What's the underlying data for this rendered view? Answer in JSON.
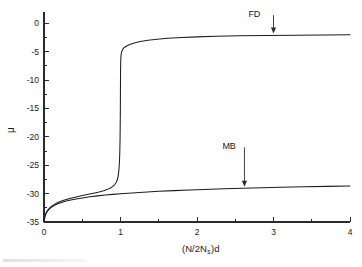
{
  "chart_data": {
    "type": "line",
    "title": "",
    "xlabel": "(N/2N_s)d",
    "xlabel_parts": {
      "pre": "(N/2N",
      "sub": "s",
      "post": ")d"
    },
    "ylabel": "μ",
    "xlim": [
      0,
      4
    ],
    "ylim": [
      -35,
      2
    ],
    "grid": false,
    "legend_position": "inline-annotations",
    "x_ticks": [
      0,
      1,
      2,
      3,
      4
    ],
    "x_tick_labels": [
      "0",
      "1",
      "2",
      "3",
      "4"
    ],
    "x_minor_ticks": [
      0.5,
      1.5,
      2.5,
      3.5
    ],
    "y_ticks": [
      0,
      -5,
      -10,
      -15,
      -20,
      -25,
      -30,
      -35
    ],
    "y_tick_labels": [
      "0",
      "-5",
      "-10",
      "-15",
      "-20",
      "-25",
      "-30",
      "-35"
    ],
    "y_minor_ticks": [
      -2.5,
      -7.5,
      -12.5,
      -17.5,
      -22.5,
      -27.5,
      -32.5
    ],
    "annotations": [
      {
        "text": "FD",
        "x": 2.75,
        "y": 1.1,
        "arrow_to_x": 3.0,
        "arrow_to_y": -1.8
      },
      {
        "text": "MB",
        "x": 2.42,
        "y": -22.2,
        "arrow_to_x": 2.62,
        "arrow_to_y": -28.8
      }
    ],
    "series": [
      {
        "name": "FD",
        "label": "Fermi-Dirac",
        "color": "#1d1d1d",
        "points": [
          [
            0.0,
            -35.0
          ],
          [
            0.01,
            -34.1
          ],
          [
            0.02,
            -33.65
          ],
          [
            0.035,
            -33.2
          ],
          [
            0.05,
            -32.9
          ],
          [
            0.075,
            -32.5
          ],
          [
            0.1,
            -32.2
          ],
          [
            0.14,
            -31.85
          ],
          [
            0.18,
            -31.58
          ],
          [
            0.23,
            -31.3
          ],
          [
            0.29,
            -31.02
          ],
          [
            0.35,
            -30.8
          ],
          [
            0.42,
            -30.58
          ],
          [
            0.5,
            -30.35
          ],
          [
            0.58,
            -30.12
          ],
          [
            0.65,
            -29.92
          ],
          [
            0.72,
            -29.7
          ],
          [
            0.78,
            -29.48
          ],
          [
            0.83,
            -29.25
          ],
          [
            0.87,
            -29.0
          ],
          [
            0.9,
            -28.72
          ],
          [
            0.925,
            -28.4
          ],
          [
            0.945,
            -28.0
          ],
          [
            0.958,
            -27.55
          ],
          [
            0.968,
            -27.0
          ],
          [
            0.976,
            -26.3
          ],
          [
            0.982,
            -25.4
          ],
          [
            0.987,
            -24.2
          ],
          [
            0.991,
            -22.6
          ],
          [
            0.994,
            -20.6
          ],
          [
            0.996,
            -18.3
          ],
          [
            0.998,
            -15.4
          ],
          [
            0.999,
            -12.6
          ],
          [
            1.0,
            -10.0
          ],
          [
            1.001,
            -8.0
          ],
          [
            1.003,
            -6.6
          ],
          [
            1.006,
            -5.8
          ],
          [
            1.011,
            -5.25
          ],
          [
            1.018,
            -4.9
          ],
          [
            1.03,
            -4.55
          ],
          [
            1.05,
            -4.25
          ],
          [
            1.08,
            -3.98
          ],
          [
            1.12,
            -3.72
          ],
          [
            1.18,
            -3.45
          ],
          [
            1.26,
            -3.2
          ],
          [
            1.36,
            -2.98
          ],
          [
            1.48,
            -2.8
          ],
          [
            1.62,
            -2.64
          ],
          [
            1.8,
            -2.5
          ],
          [
            2.0,
            -2.38
          ],
          [
            2.25,
            -2.28
          ],
          [
            2.55,
            -2.2
          ],
          [
            2.9,
            -2.13
          ],
          [
            3.3,
            -2.08
          ],
          [
            3.65,
            -2.04
          ],
          [
            4.0,
            -2.0
          ]
        ]
      },
      {
        "name": "MB",
        "label": "Maxwell-Boltzmann",
        "color": "#1d1d1d",
        "points": [
          [
            0.0,
            -35.0
          ],
          [
            0.01,
            -34.15
          ],
          [
            0.02,
            -33.7
          ],
          [
            0.035,
            -33.3
          ],
          [
            0.05,
            -33.0
          ],
          [
            0.075,
            -32.65
          ],
          [
            0.1,
            -32.38
          ],
          [
            0.14,
            -32.05
          ],
          [
            0.18,
            -31.8
          ],
          [
            0.23,
            -31.55
          ],
          [
            0.29,
            -31.32
          ],
          [
            0.35,
            -31.12
          ],
          [
            0.42,
            -30.95
          ],
          [
            0.5,
            -30.76
          ],
          [
            0.6,
            -30.56
          ],
          [
            0.7,
            -30.4
          ],
          [
            0.8,
            -30.26
          ],
          [
            0.9,
            -30.13
          ],
          [
            1.0,
            -30.02
          ],
          [
            1.15,
            -29.88
          ],
          [
            1.3,
            -29.75
          ],
          [
            1.5,
            -29.6
          ],
          [
            1.7,
            -29.47
          ],
          [
            1.9,
            -29.36
          ],
          [
            2.1,
            -29.26
          ],
          [
            2.35,
            -29.15
          ],
          [
            2.6,
            -29.05
          ],
          [
            2.85,
            -28.96
          ],
          [
            3.1,
            -28.88
          ],
          [
            3.4,
            -28.8
          ],
          [
            3.7,
            -28.72
          ],
          [
            4.0,
            -28.65
          ]
        ]
      }
    ]
  }
}
